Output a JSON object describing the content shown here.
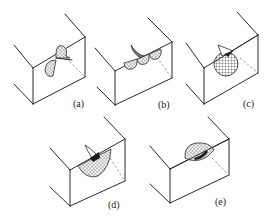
{
  "figure": {
    "panels": [
      {
        "id": "a",
        "label": "(a)",
        "pattern": "wave-lobes",
        "description": "two opposing half-lobes along edge"
      },
      {
        "id": "b",
        "label": "(b)",
        "pattern": "multi-lobes",
        "description": "three lobes along edge with curved tail"
      },
      {
        "id": "c",
        "label": "(c)",
        "pattern": "sphere",
        "description": "grid-hatched sphere at edge"
      },
      {
        "id": "d",
        "label": "(d)",
        "pattern": "fan",
        "description": "fan-shaped hatched region below edge"
      },
      {
        "id": "e",
        "label": "(e)",
        "pattern": "dome",
        "description": "hatched dome above edge"
      }
    ],
    "colors": {
      "line": "#2a2a2a",
      "dash": "#9a9a9a",
      "background": "#ffffff"
    }
  }
}
